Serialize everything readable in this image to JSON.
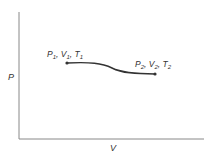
{
  "diagram": {
    "type": "P-V state diagram",
    "axes": {
      "xlabel": "V",
      "ylabel": "P"
    },
    "states": [
      {
        "id": "state-1",
        "label_parts": [
          "P",
          "1",
          "V",
          "1",
          "T",
          "1"
        ],
        "label": "P1, V1, T1"
      },
      {
        "id": "state-2",
        "label_parts": [
          "P",
          "2",
          "V",
          "2",
          "T",
          "2"
        ],
        "label": "P2, V2, T2"
      }
    ],
    "colors": {
      "line": "#333333",
      "axis": "#777777",
      "background": "#ffffff"
    }
  }
}
